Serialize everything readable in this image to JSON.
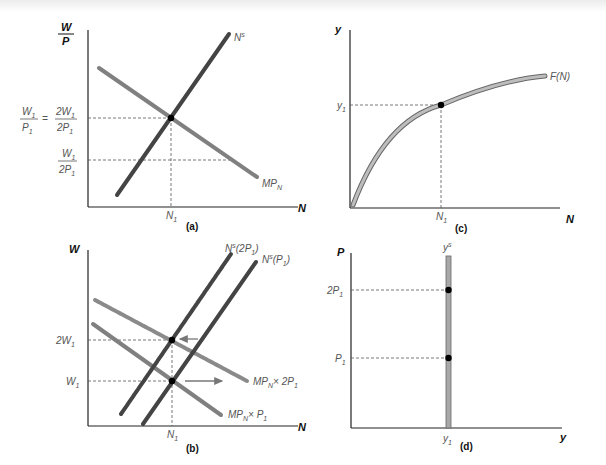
{
  "panels": {
    "a": {
      "caption": "(a)",
      "y_axis": "W/P",
      "y_axis_num": "W",
      "y_axis_den": "P",
      "x_axis": "N",
      "curves": {
        "supply": "N",
        "supply_sup": "s",
        "demand": "MP",
        "demand_sub": "N"
      },
      "y_ticks": {
        "high_lhs_num": "W",
        "high_lhs_den": "P",
        "eq": "=",
        "high_rhs_num": "2W",
        "high_rhs_den": "2P",
        "low_num": "W",
        "low_den": "2P",
        "sub": "1"
      },
      "x_tick": "N",
      "x_tick_sub": "1"
    },
    "b": {
      "caption": "(b)",
      "y_axis": "W",
      "x_axis": "N",
      "curves": {
        "supply_2p": "N",
        "supply_2p_sup": "s",
        "supply_2p_arg": "(2P",
        "supply_2p_close": ")",
        "supply_p": "N",
        "supply_p_sup": "s",
        "supply_p_arg": "(P",
        "supply_p_close": ")",
        "demand_2p": "MP",
        "demand_2p_sub": "N",
        "demand_2p_tail": "× 2P",
        "demand_p": "MP",
        "demand_p_sub": "N",
        "demand_p_tail": "× P"
      },
      "y_ticks": {
        "high": "2W",
        "low": "W",
        "sub": "1"
      },
      "x_tick": "N",
      "x_tick_sub": "1"
    },
    "c": {
      "caption": "(c)",
      "y_axis": "y",
      "x_axis": "N",
      "curve": "F(N)",
      "y_tick": "y",
      "y_tick_sub": "1",
      "x_tick": "N",
      "x_tick_sub": "1"
    },
    "d": {
      "caption": "(d)",
      "y_axis": "P",
      "x_axis": "y",
      "curve": "y",
      "curve_sup": "s",
      "y_ticks": {
        "high": "2P",
        "low": "P",
        "sub": "1"
      },
      "x_tick": "y",
      "x_tick_sub": "1"
    }
  },
  "colors": {
    "supply": "#444444",
    "demand": "#808080",
    "curve_fill": "#a8a8a8",
    "axis": "#222222",
    "guide": "#555555"
  }
}
